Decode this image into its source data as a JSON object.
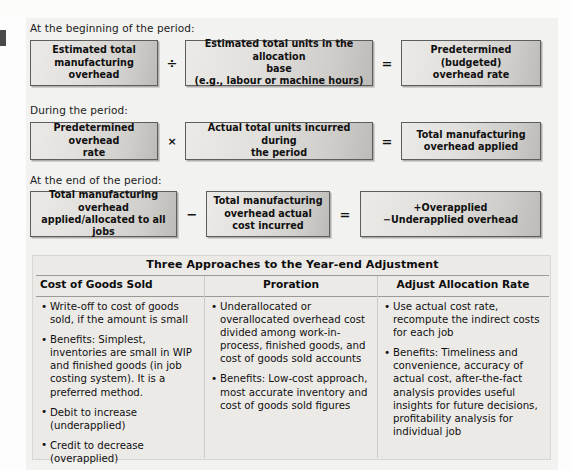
{
  "figure": {
    "sections": [
      {
        "label": "At the beginning of the period:",
        "boxes": [
          {
            "lines": [
              "Estimated total",
              "manufacturing overhead"
            ]
          },
          {
            "lines": [
              "Estimated total units in the allocation",
              "base",
              "(e.g., labour or machine hours)"
            ]
          },
          {
            "lines": [
              "Predetermined",
              "(budgeted)",
              "overhead rate"
            ]
          }
        ],
        "operators": [
          "÷",
          "="
        ]
      },
      {
        "label": "During the period:",
        "boxes": [
          {
            "lines": [
              "Predetermined overhead",
              "rate"
            ]
          },
          {
            "lines": [
              "Actual total units incurred during",
              "the period"
            ]
          },
          {
            "lines": [
              "Total manufacturing",
              "overhead applied"
            ]
          }
        ],
        "operators": [
          "×",
          "="
        ]
      },
      {
        "label": "At the end of the period:",
        "boxes": [
          {
            "lines": [
              "Total manufacturing overhead",
              "applied/allocated to all",
              "jobs"
            ]
          },
          {
            "lines": [
              "Total manufacturing",
              "overhead actual",
              "cost incurred"
            ]
          },
          {
            "lines": [
              "+Overapplied",
              "−Underapplied overhead"
            ]
          }
        ],
        "operators": [
          "−",
          "="
        ]
      }
    ]
  },
  "table": {
    "title": "Three Approaches to the Year-end Adjustment",
    "columns": [
      {
        "header": "Cost of Goods Sold",
        "bullets": [
          "Write-off to cost of goods sold, if the amount is small",
          "Benefits: Simplest, inventories are small in WIP and finished goods (in job costing system). It is a preferred method.",
          "Debit to increase (underapplied)",
          "Credit to decrease (overapplied)"
        ]
      },
      {
        "header": "Proration",
        "bullets": [
          "Underallocated or overallocated overhead cost divided among work-in-process, finished goods, and cost of goods sold accounts",
          "Benefits: Low-cost approach, most accurate inventory and cost of goods sold figures"
        ]
      },
      {
        "header": "Adjust Allocation Rate",
        "bullets": [
          "Use actual cost rate, recompute the indirect costs for each job",
          "Benefits: Timeliness and convenience, accuracy of actual cost, after-the-fact analysis provides useful insights for future decisions, profitability analysis for individual job"
        ]
      }
    ]
  },
  "colors": {
    "page_background": "#f2f2f0",
    "box_fill_light": "#eceae7",
    "box_fill_dark": "#bdbbb8",
    "box_border": "#5d5d5d",
    "text": "#101010",
    "table_background": "#eceae7",
    "rule": "#9c9a97"
  }
}
